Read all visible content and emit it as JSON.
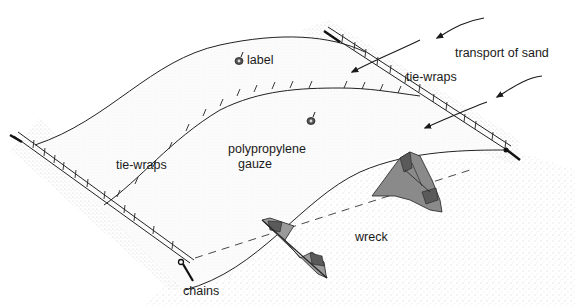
{
  "diagram": {
    "type": "illustration",
    "labels": {
      "label_tag": "label",
      "transport": "transport of sand",
      "tie_wraps_right": "tie-wraps",
      "tie_wraps_left": "tie-wraps",
      "gauze_line1": "polypropylene",
      "gauze_line2": "gauze",
      "wreck": "wreck",
      "chains": "chains"
    },
    "elements": [
      {
        "id": "gauze-sheet",
        "description": "curved polypropylene gauze sheet"
      },
      {
        "id": "left-anchor-rope",
        "description": "anchor line with tie-wraps along left/bottom edge"
      },
      {
        "id": "right-anchor-rope",
        "description": "anchor line with tie-wraps along right/top edge"
      },
      {
        "id": "middle-tie-wrap-seam",
        "description": "tie-wrap seam across gauze"
      },
      {
        "id": "sand-arrows",
        "description": "three arrows showing direction of sand transport"
      },
      {
        "id": "wreck-pieces",
        "description": "two wreck fragments protruding from sand"
      },
      {
        "id": "label-tags",
        "description": "two tag markers on gauze"
      }
    ],
    "colors": {
      "line": "#222222",
      "wreck_fill": "#8a8a8a",
      "wreck_dark": "#5a5a5a",
      "sand_dot": "#888888",
      "background": "#ffffff"
    }
  }
}
